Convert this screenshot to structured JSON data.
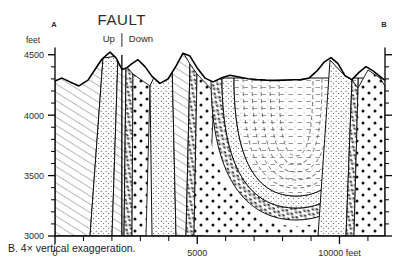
{
  "figure": {
    "caption": "B. 4× vertical exaggeration.",
    "endpoint_left": "A",
    "endpoint_right": "B",
    "fault_label": "FAULT",
    "fault_side_left": "Up",
    "fault_side_right": "Down"
  },
  "chart_data": {
    "type": "line",
    "title": "",
    "subtitle": "",
    "xlabel": "",
    "ylabel": "feet",
    "y_unit_label": "feet",
    "x_unit_suffix": "feet",
    "xlim": [
      0,
      11600
    ],
    "ylim": [
      3000,
      4560
    ],
    "grid": false,
    "legend": null,
    "y_ticks_major": [
      3000,
      3500,
      4000,
      4500
    ],
    "y_ticks_major_labels": [
      "3000",
      "3500",
      "4000",
      "4500"
    ],
    "y_tick_minor_step": 100,
    "x_ticks_major": [
      0,
      5000,
      10000
    ],
    "x_ticks_major_labels": [
      "0",
      "5000",
      "10000 feet"
    ],
    "x_tick_step": 1000,
    "fault_x": 2350,
    "series": [
      {
        "name": "Land surface (topographic profile)",
        "x": [
          0,
          220,
          480,
          780,
          1080,
          1320,
          1560,
          1800,
          2010,
          2200,
          2350,
          2500,
          2700,
          2900,
          3120,
          3360,
          3620,
          3900,
          4180,
          4420,
          4650,
          4900,
          5150,
          5420,
          5700,
          6000,
          6320,
          6650,
          7000,
          7350,
          7700,
          8050,
          8400,
          8750,
          9080,
          9380,
          9680,
          9950,
          10200,
          10450,
          10700,
          10950,
          11200,
          11450,
          11600
        ],
        "y": [
          4280,
          4300,
          4272,
          4258,
          4290,
          4360,
          4430,
          4480,
          4440,
          4360,
          4372,
          4400,
          4428,
          4380,
          4300,
          4232,
          4200,
          4240,
          4330,
          4420,
          4400,
          4320,
          4250,
          4224,
          4250,
          4270,
          4258,
          4246,
          4240,
          4236,
          4238,
          4240,
          4238,
          4236,
          4240,
          4250,
          4300,
          4360,
          4392,
          4350,
          4268,
          4240,
          4290,
          4330,
          4300
        ]
      },
      {
        "name": "Fault trace (vertical)",
        "x": [
          2350,
          2350
        ],
        "y": [
          3000,
          4560
        ]
      }
    ],
    "units": [
      {
        "name": "Basement / older bedrock",
        "pattern": "diagonal-hatch"
      },
      {
        "name": "Sandstone",
        "pattern": "fine-stipple"
      },
      {
        "name": "Conglomerate",
        "pattern": "dark-conglomerate-band"
      },
      {
        "name": "Coarse gravel / alluvium",
        "pattern": "coarse-dots"
      },
      {
        "name": "Basin fill (syncline core)",
        "pattern": "dashed-stipple"
      }
    ]
  }
}
